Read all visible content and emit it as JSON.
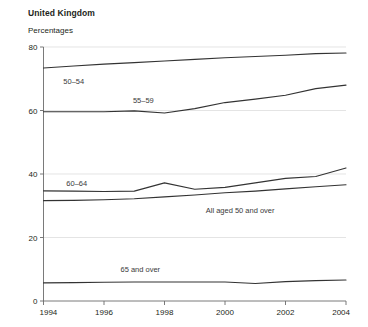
{
  "header": {
    "title": "United Kingdom",
    "subtitle": "Percentages"
  },
  "chart_data": {
    "type": "line",
    "title": "United Kingdom",
    "subtitle": "Percentages",
    "xlabel": "",
    "ylabel": "Percentages",
    "xlim": [
      1994,
      2004
    ],
    "ylim": [
      0,
      80
    ],
    "yticks": [
      0,
      20,
      40,
      60,
      80
    ],
    "xticks": [
      1994,
      1996,
      1998,
      2000,
      2002,
      2004
    ],
    "xtick_labels": [
      "1994",
      "1996",
      "1998",
      "2000",
      "2002",
      "2004"
    ],
    "ytick_labels": [
      "0",
      "20",
      "40",
      "60",
      "80"
    ],
    "grid": true,
    "legend": "inline-labels",
    "x": [
      1994,
      1995,
      1996,
      1997,
      1998,
      1999,
      2000,
      2001,
      2002,
      2003,
      2004
    ],
    "series": [
      {
        "name": "50–54",
        "label": "50–54",
        "label_x": 1995.0,
        "label_y": 68.5,
        "values": [
          73.4,
          74.0,
          74.6,
          75.1,
          75.6,
          76.1,
          76.6,
          77.0,
          77.4,
          77.9,
          78.1
        ]
      },
      {
        "name": "55–59",
        "label": "55–59",
        "label_x": 1997.3,
        "label_y": 62.5,
        "values": [
          59.6,
          59.6,
          59.6,
          59.9,
          59.2,
          60.6,
          62.5,
          63.6,
          64.8,
          66.9,
          68.0
        ]
      },
      {
        "name": "60–64",
        "label": "60–64",
        "label_x": 1995.1,
        "label_y": 36.2,
        "values": [
          34.7,
          34.6,
          34.5,
          34.6,
          37.2,
          35.2,
          35.8,
          37.2,
          38.6,
          39.2,
          41.9
        ]
      },
      {
        "name": "All aged 50 and over",
        "label": "All aged 50 and over",
        "label_x": 2000.5,
        "label_y": 27.8,
        "values": [
          31.6,
          31.7,
          31.9,
          32.2,
          32.8,
          33.4,
          34.1,
          34.6,
          35.3,
          36.0,
          36.6
        ]
      },
      {
        "name": "65 and over",
        "label": "65 and over",
        "label_x": 1997.2,
        "label_y": 9.0,
        "values": [
          5.7,
          5.8,
          5.9,
          6.0,
          6.0,
          6.0,
          6.0,
          5.5,
          6.1,
          6.4,
          6.6
        ]
      }
    ]
  }
}
